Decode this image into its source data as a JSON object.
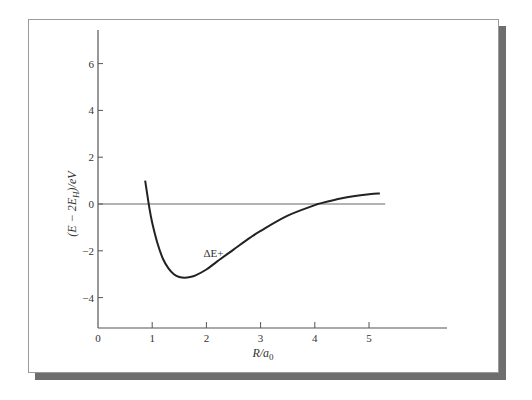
{
  "chart_data": {
    "type": "line",
    "title": "",
    "xlabel": "R/a0",
    "xlabel_main": "R/a",
    "xlabel_sub": "0",
    "ylabel": "(E − 2E_H)/eV",
    "ylabel_parts": {
      "pre": "(E − 2E",
      "sub": "H",
      "post": ")/eV"
    },
    "xlim": [
      0,
      6.4
    ],
    "ylim": [
      -5.2,
      7.5
    ],
    "x_ticks": [
      0,
      1,
      2,
      3,
      4,
      5
    ],
    "x_tick_labels": [
      "0",
      "1",
      "2",
      "3",
      "4",
      "5"
    ],
    "y_ticks": [
      6,
      4,
      2,
      0,
      -2,
      -4
    ],
    "y_tick_labels": [
      "6",
      "4",
      "2",
      "0",
      "−2",
      "−4"
    ],
    "grid": false,
    "legend": null,
    "reference_line": {
      "y": 0,
      "x_from": 0,
      "x_to": 5.3
    },
    "series": [
      {
        "name": "ΔE+",
        "x": [
          0.87,
          0.95,
          1.0,
          1.1,
          1.2,
          1.3,
          1.4,
          1.5,
          1.6,
          1.7,
          1.8,
          2.0,
          2.2,
          2.5,
          2.8,
          3.0,
          3.5,
          4.0,
          4.06,
          4.5,
          5.0,
          5.2
        ],
        "values": [
          1.0,
          -0.2,
          -0.8,
          -1.7,
          -2.35,
          -2.75,
          -3.0,
          -3.12,
          -3.15,
          -3.12,
          -3.05,
          -2.8,
          -2.45,
          -1.95,
          -1.45,
          -1.15,
          -0.5,
          -0.05,
          0.0,
          0.25,
          0.42,
          0.45
        ]
      }
    ],
    "annotations": [
      {
        "text": "ΔE+",
        "x": 2.0,
        "y": -2.1
      }
    ]
  }
}
